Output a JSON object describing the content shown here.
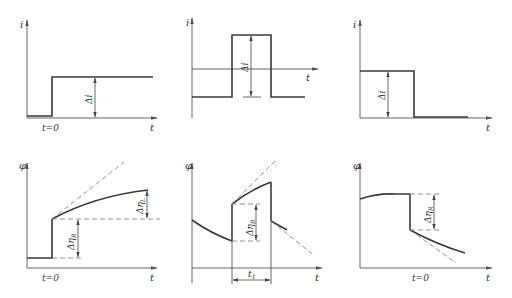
{
  "figure": {
    "colors": {
      "line": "#3a3a3a",
      "axis": "#555555",
      "dashed": "#777777",
      "background": "#ffffff"
    },
    "panels": [
      {
        "id": "top-left",
        "y_label": "i",
        "x_label": "t",
        "time_label": "t=0",
        "delta_label": "Δi",
        "shape": "current step up"
      },
      {
        "id": "top-middle",
        "y_label": "i",
        "x_label": "t",
        "delta_label": "Δi",
        "shape": "current pulse"
      },
      {
        "id": "top-right",
        "y_label": "i",
        "x_label": "t",
        "delta_label": "Δi",
        "shape": "current step down"
      },
      {
        "id": "bottom-left",
        "y_label": "φ",
        "x_label": "t",
        "time_label": "t=0",
        "delta_r_label": "Δη",
        "delta_r_sub": "R",
        "delta_l_label": "Δη",
        "delta_l_sub": "L",
        "shape": "potential jump then rising curve"
      },
      {
        "id": "bottom-middle",
        "y_label": "φ",
        "x_label": "t",
        "delta_r_label": "Δη",
        "delta_r_sub": "R",
        "duration_label": "t",
        "duration_sub": "1",
        "shape": "potential response to pulse"
      },
      {
        "id": "bottom-right",
        "y_label": "φ",
        "x_label": "t",
        "time_label": "t=0",
        "delta_r_label": "Δη",
        "delta_r_sub": "R",
        "shape": "potential drop then decaying curve"
      }
    ]
  }
}
